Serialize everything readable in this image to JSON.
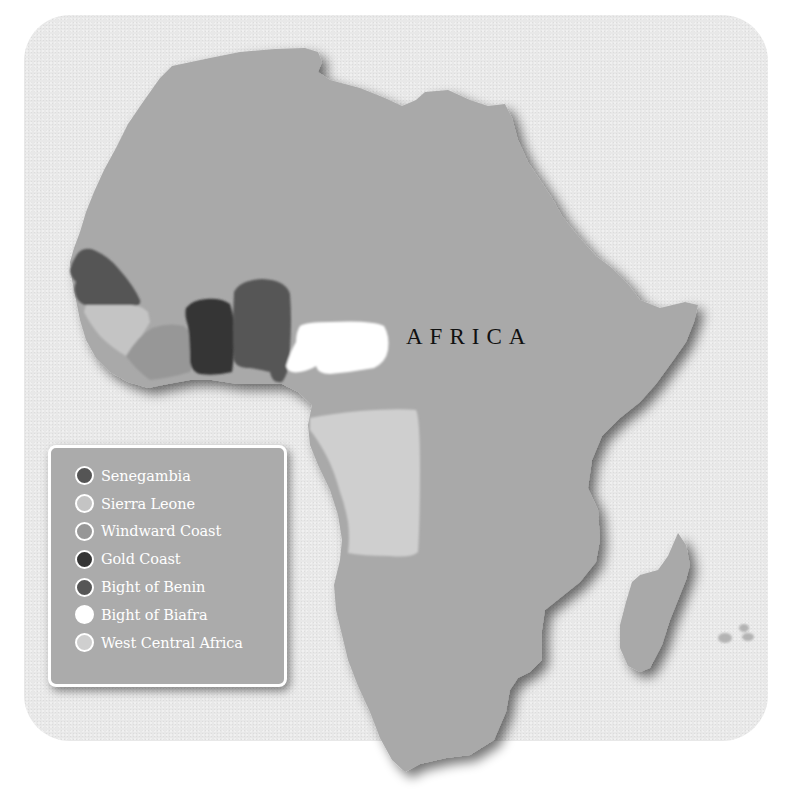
{
  "map": {
    "continent_label": "AFRICA",
    "colors": {
      "frame_background": "#e8e8e8",
      "land": "#a9a9a9",
      "legend_background": "#ababab",
      "legend_text": "#ffffff"
    }
  },
  "legend": {
    "items": [
      {
        "label": "Senegambia",
        "color": "#555555"
      },
      {
        "label": "Sierra Leone",
        "color": "#c4c4c4"
      },
      {
        "label": "Windward Coast",
        "color": "#979797"
      },
      {
        "label": "Gold Coast",
        "color": "#353535"
      },
      {
        "label": "Bight of Benin",
        "color": "#565656"
      },
      {
        "label": "Bight of Biafra",
        "color": "#ffffff"
      },
      {
        "label": "West Central Africa",
        "color": "#cfcfcf"
      }
    ]
  }
}
